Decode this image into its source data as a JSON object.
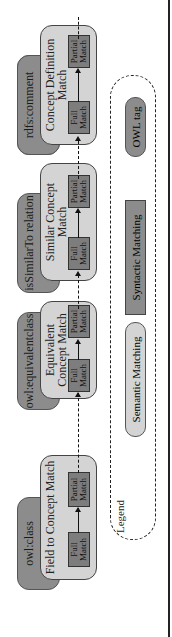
{
  "groups": [
    {
      "tag": "owl:class",
      "title": "Field to Concept Match",
      "full": "Full Match",
      "partial": "Partial Match"
    },
    {
      "tag": "owl:equivalentclass",
      "title": "Equivalent Concept Match",
      "full": "Full Match",
      "partial": "Partial Match"
    },
    {
      "tag": "isSimilarTo relation",
      "title": "Similar Concept Match",
      "full": "Full Match",
      "partial": "Partial Match"
    },
    {
      "tag": "rdfs:comment",
      "title": "Concept Definition Match",
      "full": "Full Match",
      "partial": "Partial Match"
    }
  ],
  "legend": {
    "label": "Legend",
    "semantic": "Semantic Matching",
    "syntactic": "Syntactic Matching",
    "owl_tag": "OWL tag"
  },
  "colors": {
    "semantic_fill": "#d4d4d4",
    "syntactic_fill": "#7d7d7d",
    "owl_tag_fill": "#8c8c8c"
  }
}
